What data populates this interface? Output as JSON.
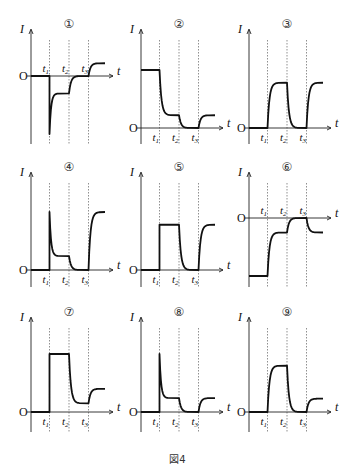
{
  "figure": {
    "caption": "図4",
    "y_axis_label": "I",
    "x_axis_label": "t",
    "origin_label": "O",
    "time_marks": [
      "t1",
      "t2",
      "t3"
    ]
  },
  "chart_data": {
    "type": "line",
    "title": "図4",
    "xlabel": "t",
    "ylabel": "I",
    "note": "Nine current-vs-time sketches; levels are relative (0 = axis, 1 = plot top). Segments: 0–t1, t1–t2, t2–t3, after t3.",
    "panels": [
      {
        "id": 1,
        "label": "①",
        "origin_y": 76,
        "col": 0,
        "levels": [
          0,
          -0.3,
          0,
          0.22
        ],
        "transitions": [
          "spike-down-decay",
          "exp",
          "exp"
        ],
        "spike": -1.0
      },
      {
        "id": 2,
        "label": "②",
        "origin_y": 128,
        "col": 1,
        "levels": [
          1.0,
          0.22,
          0,
          0.22
        ],
        "transitions": [
          "exp",
          "exp",
          "exp"
        ]
      },
      {
        "id": 3,
        "label": "③",
        "origin_y": 128,
        "col": 2,
        "levels": [
          0,
          0.78,
          0,
          0.78
        ],
        "transitions": [
          "exp",
          "exp",
          "exp"
        ]
      },
      {
        "id": 4,
        "label": "④",
        "origin_y": 270,
        "col": 0,
        "levels": [
          0,
          0.24,
          0,
          1.0
        ],
        "transitions": [
          "spike-up-decay",
          "exp",
          "exp"
        ],
        "spike": 1.0
      },
      {
        "id": 5,
        "label": "⑤",
        "origin_y": 270,
        "col": 1,
        "levels": [
          0,
          0.78,
          0,
          0.78
        ],
        "transitions": [
          "step",
          "exp",
          "exp"
        ]
      },
      {
        "id": 6,
        "label": "⑥",
        "origin_y": 218,
        "col": 2,
        "levels": [
          -1.0,
          -0.25,
          0,
          -0.25
        ],
        "transitions": [
          "exp",
          "exp",
          "exp"
        ]
      },
      {
        "id": 7,
        "label": "⑦",
        "origin_y": 412,
        "col": 0,
        "levels": [
          0,
          1.0,
          0.15,
          0.4
        ],
        "transitions": [
          "step",
          "exp",
          "exp"
        ]
      },
      {
        "id": 8,
        "label": "⑧",
        "origin_y": 412,
        "col": 1,
        "levels": [
          0,
          0.24,
          0,
          0.24
        ],
        "transitions": [
          "spike-up-decay",
          "exp",
          "exp"
        ],
        "spike": 1.0
      },
      {
        "id": 9,
        "label": "⑨",
        "origin_y": 412,
        "col": 2,
        "levels": [
          0,
          0.8,
          0,
          0.23
        ],
        "transitions": [
          "exp",
          "exp",
          "exp"
        ]
      }
    ]
  }
}
